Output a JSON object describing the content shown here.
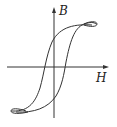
{
  "diagram": {
    "type": "hysteresis-loop",
    "axes": {
      "y_label": "B",
      "x_label": "H"
    },
    "colors": {
      "stroke": "#333333",
      "background": "#ffffff"
    }
  }
}
